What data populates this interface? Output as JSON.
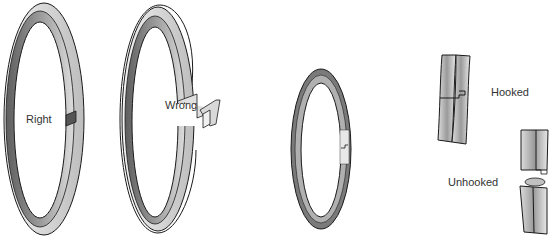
{
  "diagram": {
    "type": "piston-ring-installation",
    "labels": {
      "right": "Right",
      "wrong": "Wrong",
      "hooked": "Hooked",
      "unhooked": "Unhooked"
    },
    "colors": {
      "ring_dark": "#6e6e6e",
      "ring_mid": "#a8a8a8",
      "ring_light": "#e6e6e6",
      "outline": "#1a1a1a",
      "text": "#333333",
      "background": "#ffffff"
    }
  }
}
